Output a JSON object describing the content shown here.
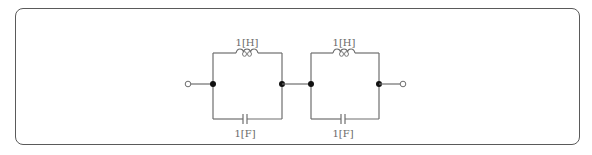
{
  "diagram": {
    "type": "circuit",
    "colors": {
      "wire": "#6e6e6e",
      "node": "#111111",
      "frame": "#5a5a5a",
      "label": "#6a6a6a"
    },
    "terminals": [
      {
        "id": "left-terminal",
        "x": 188,
        "y": 84
      },
      {
        "id": "right-terminal",
        "x": 403,
        "y": 84
      }
    ],
    "sections": [
      {
        "id": "section-1",
        "inductor": {
          "label": "1[H]",
          "value": 1,
          "unit": "H"
        },
        "capacitor": {
          "label": "1[F]",
          "value": 1,
          "unit": "F"
        }
      },
      {
        "id": "section-2",
        "inductor": {
          "label": "1[H]",
          "value": 1,
          "unit": "H"
        },
        "capacitor": {
          "label": "1[F]",
          "value": 1,
          "unit": "F"
        }
      }
    ]
  }
}
